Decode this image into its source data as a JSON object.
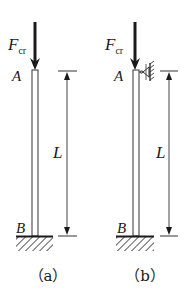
{
  "figure": {
    "panels": [
      {
        "id": "a",
        "caption": "（a）",
        "force_label_main": "F",
        "force_label_sub": "cr",
        "top_label": "A",
        "bottom_label": "B",
        "length_label": "L",
        "top_support": "free",
        "bottom_support": "fixed"
      },
      {
        "id": "b",
        "caption": "（b）",
        "force_label_main": "F",
        "force_label_sub": "cr",
        "top_label": "A",
        "bottom_label": "B",
        "length_label": "L",
        "top_support": "roller-guided",
        "bottom_support": "fixed"
      }
    ]
  }
}
